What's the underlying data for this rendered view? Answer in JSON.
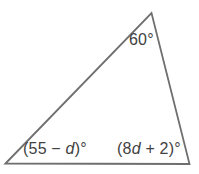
{
  "figure": {
    "shape": "triangle",
    "background_color": "#ffffff",
    "line_color": "#6f6f6f",
    "text_color": "#414141",
    "angle_labels": {
      "top": {
        "text": "60°"
      },
      "bottom_left": {
        "open": "(55 − ",
        "variable": "d",
        "close": ")°"
      },
      "bottom_right": {
        "open": "(8",
        "variable": "d",
        "close": " + 2)°"
      }
    }
  }
}
